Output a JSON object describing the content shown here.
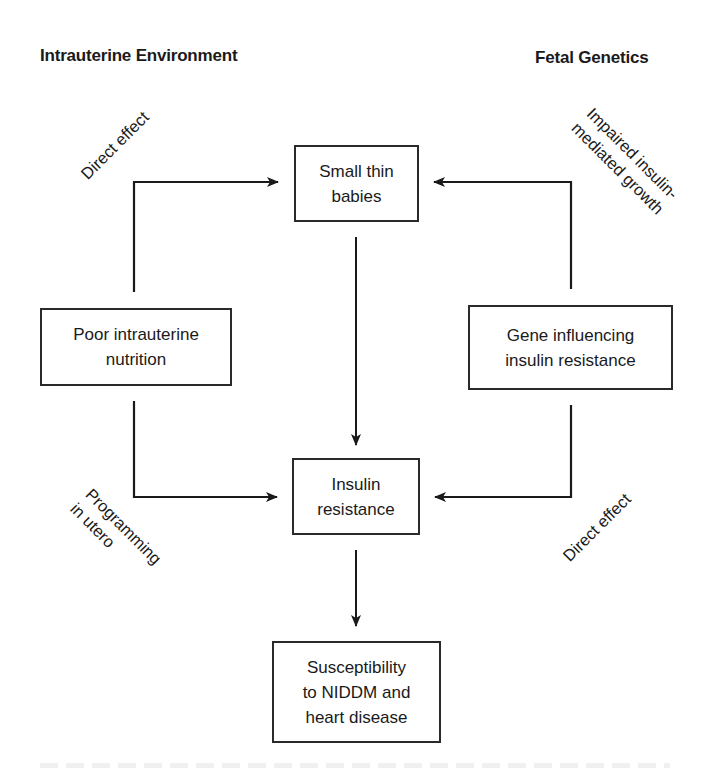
{
  "headings": {
    "left": "Intrauterine Environment",
    "right": "Fetal Genetics"
  },
  "nodes": {
    "small_thin_babies": [
      "Small thin",
      "babies"
    ],
    "poor_nutrition": [
      "Poor intrauterine",
      "nutrition"
    ],
    "gene_insulin": [
      "Gene influencing",
      "insulin resistance"
    ],
    "insulin_resistance": [
      "Insulin",
      "resistance"
    ],
    "susceptibility": [
      "Susceptibility",
      "to NIDDM and",
      "heart disease"
    ]
  },
  "edge_labels": {
    "top_left": [
      "Direct effect"
    ],
    "top_right": [
      "Impaired insulin-",
      "mediated growth"
    ],
    "bottom_left": [
      "Programming",
      "in utero"
    ],
    "bottom_right": [
      "Direct effect"
    ]
  },
  "edges": [
    {
      "from": "poor_nutrition",
      "to": "small_thin_babies",
      "label": "Direct effect"
    },
    {
      "from": "gene_insulin",
      "to": "small_thin_babies",
      "label": "Impaired insulin-mediated growth"
    },
    {
      "from": "small_thin_babies",
      "to": "insulin_resistance",
      "label": ""
    },
    {
      "from": "poor_nutrition",
      "to": "insulin_resistance",
      "label": "Programming in utero"
    },
    {
      "from": "gene_insulin",
      "to": "insulin_resistance",
      "label": "Direct effect"
    },
    {
      "from": "insulin_resistance",
      "to": "susceptibility",
      "label": ""
    }
  ],
  "colors": {
    "line": "#1a1a1a",
    "background": "#ffffff"
  }
}
